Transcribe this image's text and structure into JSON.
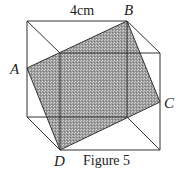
{
  "figure": {
    "caption": "Figure 5",
    "dimension_label": "4cm",
    "vertices": {
      "A": "A",
      "B": "B",
      "C": "C",
      "D": "D"
    },
    "cube": {
      "back_face": [
        [
          27,
          21
        ],
        [
          127,
          21
        ],
        [
          127,
          117
        ],
        [
          27,
          117
        ]
      ],
      "front_face": [
        [
          60,
          53
        ],
        [
          160,
          53
        ],
        [
          160,
          150
        ],
        [
          60,
          150
        ]
      ]
    },
    "shaded_quad": {
      "A": [
        27,
        68
      ],
      "B": [
        127,
        21
      ],
      "C": [
        160,
        102
      ],
      "D": [
        60,
        150
      ]
    },
    "colors": {
      "line": "#333333",
      "shade": "#9a9a9a",
      "shade_dot": "#d8d8d8"
    }
  }
}
